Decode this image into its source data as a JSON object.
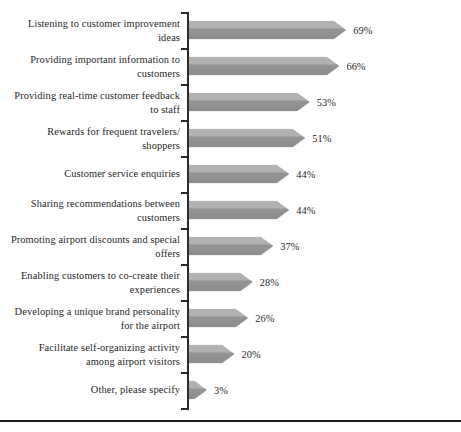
{
  "chart_data": {
    "type": "bar",
    "orientation": "horizontal",
    "title": "",
    "subtitle": "",
    "xlabel": "",
    "ylabel": "",
    "xlim": [
      0,
      100
    ],
    "grid": false,
    "legend": null,
    "value_suffix": "%",
    "categories": [
      "Listening to customer improvement\nideas",
      "Providing important information to\ncustomers",
      "Providing real-time customer feedback\nto staff",
      "Rewards for frequent travelers/\nshoppers",
      "Customer service enquiries",
      "Sharing recommendations between\ncustomers",
      "Promoting airport discounts and special\noffers",
      "Enabling customers to co-create their\nexperiences",
      "Developing a unique brand personality\nfor the airport",
      "Facilitate self-organizing activity\namong airport visitors",
      "Other, please specify"
    ],
    "values": [
      69,
      66,
      53,
      51,
      44,
      44,
      37,
      28,
      26,
      20,
      3
    ],
    "value_labels": [
      "69%",
      "66%",
      "53%",
      "51%",
      "44%",
      "44%",
      "37%",
      "28%",
      "26%",
      "20%",
      "3%"
    ],
    "colors": {
      "bar_light": "#b2b2b2",
      "bar_dark": "#8c8c8c",
      "axis": "#2b2b2b",
      "text": "#1f1f1f",
      "background": "#ffffff",
      "bottom_rule": "#181818"
    }
  }
}
